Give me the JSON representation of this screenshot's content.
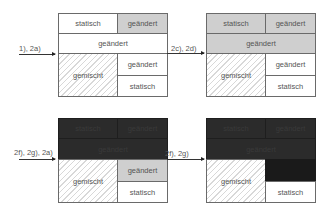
{
  "diagram": {
    "labels": {
      "static": "statisch",
      "changed": "geändert",
      "mixed": "gemischt"
    },
    "arrows": [
      {
        "label": "1), 2a)"
      },
      {
        "label": "2c), 2d)"
      },
      {
        "label": "2f), 2g), 2a)"
      },
      {
        "label": "2f), 2g)"
      }
    ],
    "states": [
      {
        "name": "state-1",
        "top_left": "statisch",
        "top_right": "geändert",
        "middle": "geändert",
        "bottom_left": "gemischt",
        "bottom_right_top": "geändert",
        "bottom_right_bottom": "statisch"
      },
      {
        "name": "state-2",
        "top_left": "statisch",
        "top_right": "geändert",
        "middle": "geändert",
        "bottom_left": "gemischt",
        "bottom_right_top": "geändert",
        "bottom_right_bottom": "statisch"
      },
      {
        "name": "state-3",
        "top_left": "statisch",
        "top_right": "geändert",
        "middle": "geändert",
        "bottom_left": "gemischt",
        "bottom_right_top": "geändert",
        "bottom_right_bottom": "statisch"
      },
      {
        "name": "state-4",
        "top_left": "statisch",
        "top_right": "geändert",
        "middle": "geändert",
        "bottom_left": "gemischt",
        "bottom_right_top": "geändert",
        "bottom_right_bottom": "statisch"
      }
    ],
    "colors": {
      "white": "#ffffff",
      "gray": "#cfcfcf",
      "dark": "#2b2b2b",
      "border": "#6a6a6a"
    }
  }
}
